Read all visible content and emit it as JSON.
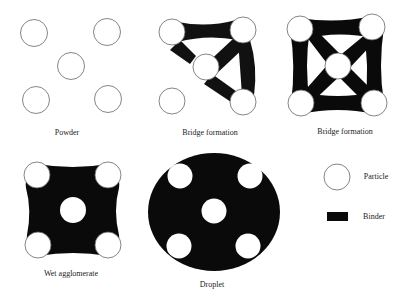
{
  "colors": {
    "background": "#ffffff",
    "binder": "#0a0a0a",
    "particle_fill": "#ffffff",
    "particle_stroke": "#555555"
  },
  "panels": [
    {
      "label": "Powder"
    },
    {
      "label": "Bridge formation"
    },
    {
      "label": "Bridge formation"
    },
    {
      "label": "Wet agglomerate"
    },
    {
      "label": "Droplet"
    }
  ],
  "legend": {
    "items": [
      {
        "label": "Particle",
        "icon": "particle-circle"
      },
      {
        "label": "Binder",
        "icon": "binder-rectangle"
      }
    ]
  }
}
